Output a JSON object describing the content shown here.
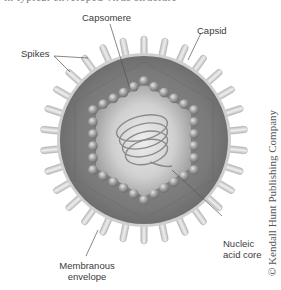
{
  "figure": {
    "title_cutoff": "in typical enveloped virus structure",
    "labels": {
      "capsomere": "Capsomere",
      "capsid": "Capsid",
      "spikes": "Spikes",
      "nucleic_acid_core_line1": "Nucleic",
      "nucleic_acid_core_line2": "acid core",
      "membranous_envelope_line1": "Membranous",
      "membranous_envelope_line2": "envelope"
    },
    "copyright": "© Kendall Hunt Publishing Company"
  },
  "geometry": {
    "center": [
      144,
      140
    ],
    "envelope_radius": 87,
    "spike_length": 17,
    "spike_count": 30,
    "bead_hexagon_vertices": [
      [
        144,
        81
      ],
      [
        194,
        110
      ],
      [
        194,
        170
      ],
      [
        144,
        200
      ],
      [
        93,
        170
      ],
      [
        93,
        110
      ]
    ],
    "bead_radius": 4.8
  },
  "colors": {
    "envelope_fill": "#7c7c7c",
    "envelope_rim": "#c9c9c9",
    "spike_fill": "#dcdcdc",
    "bead_fill": "#9a9a9a",
    "core_fill": "#d8d8d8",
    "text": "#3a3a3a"
  }
}
